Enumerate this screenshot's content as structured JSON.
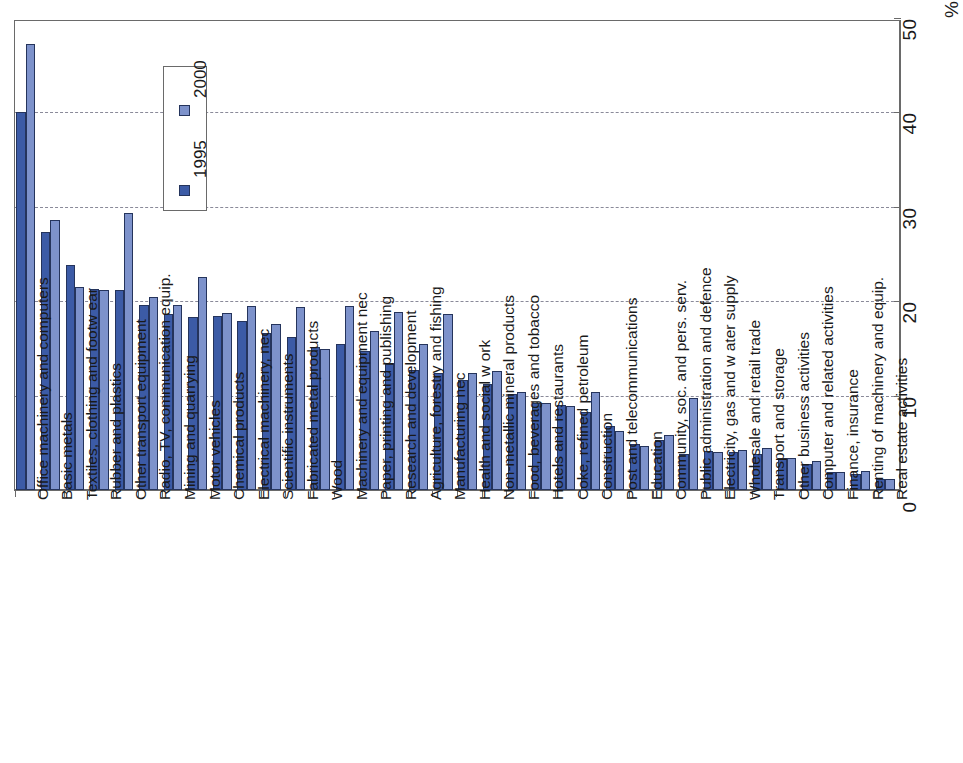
{
  "chart_data": {
    "type": "bar",
    "title": "",
    "subtitle": "",
    "xlabel": "",
    "ylabel": "%",
    "orientation": "vertical-bars-rotated-90",
    "grid": true,
    "legend_position": "inside-upper-left",
    "ylim": [
      0,
      50
    ],
    "yticks": [
      0,
      10,
      20,
      30,
      40,
      50
    ],
    "ytick_labels": [
      "0",
      "10",
      "20",
      "30",
      "40",
      "50"
    ],
    "unit": "%",
    "categories": [
      "Office machinery and computers",
      "Basic metals",
      "Textiles, clothing and footw ear",
      "Rubber and plastics",
      "Other transport equipment",
      "Radio, TV, communication equip.",
      "Mining and quarrying",
      "Motor vehicles",
      "Chemical products",
      "Electrical machinery, nec",
      "Scientific instruments",
      "Fabricated metal products",
      "Wood",
      "Machinery and equipment nec",
      "Paper, printing and publishing",
      "Research and development",
      "Agriculture, forestry and fishing",
      "Manufacturing nec",
      "Health and social w ork",
      "Non-metallic mineral products",
      "Food, beverages and tobacco",
      "Hotels and restaurants",
      "Coke, refined petroleum",
      "Construction",
      "Post and telecommunications",
      "Education",
      "Community, soc. and pers. serv.",
      "Public administration and defence",
      "Electricity, gas and w ater supply",
      "Wholesale and retail trade",
      "Transport and storage",
      "Other business activities",
      "Computer and related activities",
      "Finance, insurance",
      "Renting of machinery and equip.",
      "Real estate activities"
    ],
    "series": [
      {
        "name": "1995",
        "color": "#3c5ba6",
        "values": [
          40.0,
          27.3,
          23.8,
          21.3,
          21.2,
          19.6,
          18.6,
          18.3,
          18.4,
          17.9,
          16.6,
          16.2,
          15.2,
          15.5,
          14.7,
          13.4,
          12.7,
          12.4,
          11.7,
          11.2,
          10.2,
          9.2,
          9.0,
          8.3,
          6.8,
          4.9,
          5.3,
          3.8,
          4.1,
          4.0,
          3.8,
          3.4,
          2.8,
          1.9,
          1.7,
          1.2
        ]
      },
      {
        "name": "2000",
        "color": "#7d92cb",
        "values": [
          47.2,
          28.6,
          21.5,
          21.2,
          29.3,
          20.4,
          19.6,
          22.6,
          18.8,
          19.5,
          17.6,
          19.4,
          14.9,
          19.5,
          16.8,
          18.9,
          15.5,
          18.6,
          12.4,
          12.6,
          10.4,
          9.2,
          8.9,
          10.4,
          6.3,
          4.7,
          5.8,
          9.7,
          4.0,
          4.2,
          4.4,
          3.4,
          3.1,
          1.9,
          2.0,
          1.2
        ]
      }
    ]
  },
  "legend": {
    "entries": [
      {
        "label": "1995"
      },
      {
        "label": "2000"
      }
    ]
  },
  "axis": {
    "unit_label": "%"
  }
}
